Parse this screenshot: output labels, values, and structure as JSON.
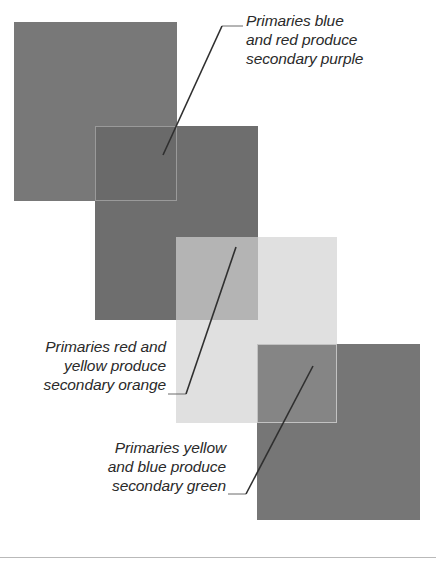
{
  "figure": {
    "type": "color-theory-overlap-diagram",
    "background_color": "#ffffff"
  },
  "swatches": [
    {
      "id": "blue-1",
      "color_name": "blue",
      "role": "primary",
      "render_color": "#787878"
    },
    {
      "id": "red",
      "color_name": "red",
      "role": "primary",
      "render_color": "#6e6e6e"
    },
    {
      "id": "yellow",
      "color_name": "yellow",
      "role": "primary",
      "render_color": "#e0e0e0"
    },
    {
      "id": "blue-2",
      "color_name": "blue",
      "role": "primary",
      "render_color": "#767676"
    }
  ],
  "overlaps": [
    {
      "id": "purple",
      "color_name": "purple",
      "role": "secondary",
      "parents": [
        "blue",
        "red"
      ],
      "render_color": "#6a6a6a"
    },
    {
      "id": "orange",
      "color_name": "orange",
      "role": "secondary",
      "parents": [
        "red",
        "yellow"
      ],
      "render_color": "#b4b4b4"
    },
    {
      "id": "green",
      "color_name": "green",
      "role": "secondary",
      "parents": [
        "yellow",
        "blue"
      ],
      "render_color": "#858585"
    }
  ],
  "callouts": {
    "purple": {
      "text": "Primaries blue\nand red produce\nsecondary purple",
      "align": "left"
    },
    "orange": {
      "text": "Primaries red and\nyellow produce\nsecondary orange",
      "align": "right"
    },
    "green": {
      "text": "Primaries yellow\nand blue produce\nsecondary green",
      "align": "right"
    }
  },
  "leader_lines": {
    "stroke_color": "#3a3a3a",
    "thin_stroke_color": "#6b6b6b"
  }
}
